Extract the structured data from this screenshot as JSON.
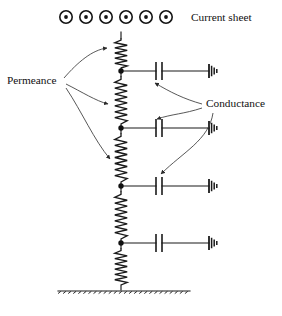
{
  "figure": {
    "background_color": "#ffffff",
    "line_color": "#1a1a1a",
    "width": 282,
    "height": 316
  },
  "labels": {
    "current_sheet": "Current sheet",
    "permeance": "Permeance",
    "conductance": "Conductance"
  },
  "current_sheet": {
    "symbol_name": "current-out-of-page",
    "count": 6,
    "glyph": "⊙",
    "x_positions": [
      66,
      86,
      106,
      126,
      146,
      166
    ],
    "y": 17,
    "outer_radius": 6.2,
    "inner_radius": 1.9
  },
  "ladder": {
    "rail_x": 121,
    "top_y": 32,
    "bottom_y": 290,
    "nodes": [
      {
        "name": "node-1",
        "y": 71
      },
      {
        "name": "node-2",
        "y": 128
      },
      {
        "name": "node-3",
        "y": 186
      },
      {
        "name": "node-4",
        "y": 243
      }
    ],
    "series_elements": [
      {
        "name": "permeance-resistor-1",
        "y_start": 38,
        "y_end": 68,
        "zigzags": 5
      },
      {
        "name": "permeance-resistor-2",
        "y_start": 76,
        "y_end": 124,
        "zigzags": 7
      },
      {
        "name": "permeance-resistor-3",
        "y_start": 133,
        "y_end": 182,
        "zigzags": 7
      },
      {
        "name": "permeance-resistor-4",
        "y_start": 191,
        "y_end": 239,
        "zigzags": 7
      },
      {
        "name": "permeance-resistor-5",
        "y_start": 248,
        "y_end": 285,
        "zigzags": 6
      }
    ],
    "shunt_branches": [
      {
        "name": "conductance-branch-1",
        "y": 71,
        "cap_x": 159,
        "ground_x": 209
      },
      {
        "name": "conductance-branch-2",
        "y": 128,
        "cap_x": 159,
        "ground_x": 209
      },
      {
        "name": "conductance-branch-3",
        "y": 186,
        "cap_x": 159,
        "ground_x": 209
      },
      {
        "name": "conductance-branch-4",
        "y": 243,
        "cap_x": 159,
        "ground_x": 209
      }
    ],
    "capacitor": {
      "plate_gap": 6,
      "plate_half_height": 9
    },
    "ground_symbol": {
      "bars": 4,
      "heights": [
        14,
        10.5,
        7,
        4
      ],
      "spacing": 2.6
    }
  },
  "bottom_plane": {
    "name": "ground-plane",
    "y": 291,
    "x_start": 58,
    "x_end": 190,
    "hatch_count": 26
  },
  "label_positions": {
    "current_sheet": {
      "x": 191,
      "y": 21,
      "anchor": "start"
    },
    "permeance": {
      "x": 7,
      "y": 84,
      "anchor": "start"
    },
    "conductance": {
      "x": 206,
      "y": 107,
      "anchor": "start"
    }
  },
  "permeance_arrows": [
    {
      "name": "permeance-arrow-1",
      "path": "M 64 78 C 78 62 92 50 107 48",
      "target": "permeance-resistor-1"
    },
    {
      "name": "permeance-arrow-2",
      "path": "M 66 84 C 82 92 96 101 108 104",
      "target": "permeance-resistor-2"
    },
    {
      "name": "permeance-arrow-3",
      "path": "M 66 88 C 82 112 94 140 110 159",
      "target": "permeance-resistor-3"
    }
  ],
  "conductance_arrows": [
    {
      "name": "conductance-arrow-1",
      "path": "M 202 104 C 184 99 170 92 155 83",
      "target": "conductance-branch-1"
    },
    {
      "name": "conductance-arrow-2",
      "path": "M 202 108 C 184 114 172 114 157 119",
      "target": "conductance-branch-2"
    },
    {
      "name": "conductance-arrow-3",
      "path": "M 213 113 C 209 140 183 152 161 174",
      "target": "conductance-branch-3"
    }
  ]
}
